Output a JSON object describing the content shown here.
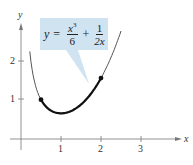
{
  "chart_data": {
    "type": "line",
    "title": "",
    "function": "y = x^3/6 + 1/(2x)",
    "xlabel": "x",
    "ylabel": "y",
    "xticks": [
      "1",
      "2",
      "3"
    ],
    "yticks": [
      "1",
      "2"
    ],
    "xlim": [
      0,
      3.8
    ],
    "ylim": [
      0,
      2.7
    ],
    "grid": false,
    "series": [
      {
        "name": "curve (thin)",
        "x_range": [
          0.22,
          2.5
        ]
      },
      {
        "name": "highlighted arc (thick)",
        "x_range": [
          0.5,
          2
        ]
      }
    ],
    "points": [
      {
        "x": 0.5,
        "y": 1.04
      },
      {
        "x": 2,
        "y": 1.58
      }
    ],
    "annotation": {
      "lhs": "y",
      "eq": "=",
      "term1_num": "x",
      "term1_exp": "3",
      "term1_den": "6",
      "plus": "+",
      "term2_num": "1",
      "term2_den": "2x"
    },
    "colors": {
      "callout": "#cfe3f0",
      "curve": "#555555",
      "arc": "#111111",
      "axis": "#666666"
    }
  }
}
